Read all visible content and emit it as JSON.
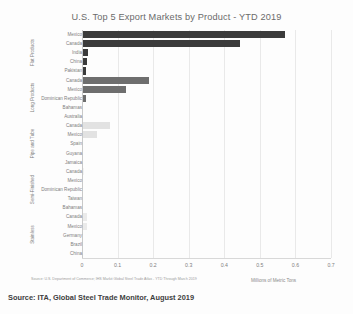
{
  "chart": {
    "title": "U.S. Top 5 Export Markets by Product - YTD 2019",
    "xlabel": "Millions of Metric Tons",
    "source_note": "Source: U.S. Department of Commerce; IHS Markit Global Steel Trade Atlas - YTD Through March 2019",
    "caption": "Source: ITA, Global Steel Trade Monitor, August 2019"
  },
  "chart_data": {
    "type": "bar",
    "orientation": "horizontal",
    "title": "U.S. Top 5 Export Markets by Product - YTD 2019",
    "xlabel": "Millions of Metric Tons",
    "ylabel": "",
    "xlim": [
      0,
      0.7
    ],
    "grid": true,
    "legend": "none",
    "xticks": [
      "0",
      "0.1",
      "0.2",
      "0.3",
      "0.4",
      "0.5",
      "0.6",
      "0.7"
    ],
    "xtick_values": [
      0,
      0.1,
      0.2,
      0.3,
      0.4,
      0.5,
      0.6,
      0.7
    ],
    "groups": [
      {
        "name": "Flat Products",
        "color": "#3b3b3b",
        "categories": [
          "Mexico",
          "Canada",
          "India",
          "China",
          "Pakistan"
        ],
        "values": [
          0.572,
          0.445,
          0.018,
          0.014,
          0.011
        ]
      },
      {
        "name": "Long Products",
        "color": "#6e6e6e",
        "categories": [
          "Canada",
          "Mexico",
          "Dominican Republic",
          "Bahamas",
          "Australia"
        ],
        "values": [
          0.188,
          0.125,
          0.011,
          0.004,
          0.003
        ]
      },
      {
        "name": "Pipe and Tube",
        "color": "#e2e2e2",
        "categories": [
          "Canada",
          "Mexico",
          "Spain",
          "Guyana",
          "Jamaica"
        ],
        "values": [
          0.079,
          0.041,
          0.004,
          0.002,
          0.002
        ]
      },
      {
        "name": "Semi-Finished",
        "color": "#f2f2f2",
        "categories": [
          "Canada",
          "Mexico",
          "Dominican Republic",
          "Taiwan",
          "Bahamas"
        ],
        "values": [
          0.005,
          0.004,
          0.002,
          0.002,
          0.001
        ]
      },
      {
        "name": "Stainless",
        "color": "#eaeaea",
        "categories": [
          "Canada",
          "Mexico",
          "Germany",
          "Brazil",
          "China"
        ],
        "values": [
          0.015,
          0.013,
          0.004,
          0.003,
          0.002
        ]
      }
    ]
  }
}
